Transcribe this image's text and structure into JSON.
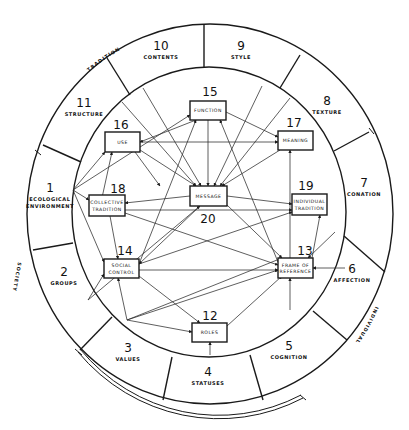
{
  "diagram": {
    "outer_ring": {
      "cx": 210,
      "cy": 214,
      "rx": 183,
      "ry": 190
    },
    "inner_ring": {
      "cx": 209,
      "cy": 212,
      "rx": 137,
      "ry": 145
    },
    "groups": [
      {
        "id": "tradition",
        "label": "TRADITION"
      },
      {
        "id": "society",
        "label": "SOCIETY"
      },
      {
        "id": "individual",
        "label": "INDIVIDUAL"
      }
    ],
    "ring_sections": [
      {
        "number": "1",
        "label_lines": [
          "ECOLOGICAL",
          "ENVIRONMENT"
        ],
        "x": 50,
        "y": 192
      },
      {
        "number": "2",
        "label_lines": [
          "GROUPS"
        ],
        "x": 64,
        "y": 276
      },
      {
        "number": "3",
        "label_lines": [
          "VALUES"
        ],
        "x": 128,
        "y": 352
      },
      {
        "number": "4",
        "label_lines": [
          "STATUSES"
        ],
        "x": 208,
        "y": 376
      },
      {
        "number": "5",
        "label_lines": [
          "COGNITION"
        ],
        "x": 289,
        "y": 350
      },
      {
        "number": "6",
        "label_lines": [
          "AFFECTION"
        ],
        "x": 352,
        "y": 273
      },
      {
        "number": "7",
        "label_lines": [
          "CONATION"
        ],
        "x": 364,
        "y": 187
      },
      {
        "number": "8",
        "label_lines": [
          "TEXTURE"
        ],
        "x": 327,
        "y": 105
      },
      {
        "number": "9",
        "label_lines": [
          "STYLE"
        ],
        "x": 241,
        "y": 50
      },
      {
        "number": "10",
        "label_lines": [
          "CONTENTS"
        ],
        "x": 161,
        "y": 50
      },
      {
        "number": "11",
        "label_lines": [
          "STRUCTURE"
        ],
        "x": 84,
        "y": 107
      }
    ],
    "boxes": [
      {
        "id": "function",
        "number": "15",
        "label_lines": [
          "FUNCTION"
        ],
        "x": 190,
        "y": 101,
        "w": 36,
        "h": 19,
        "num_x": 210,
        "num_y": 96
      },
      {
        "id": "use",
        "number": "16",
        "label_lines": [
          "USE"
        ],
        "x": 105,
        "y": 132,
        "w": 35,
        "h": 20,
        "num_x": 121,
        "num_y": 129
      },
      {
        "id": "meaning",
        "number": "17",
        "label_lines": [
          "MEANING"
        ],
        "x": 278,
        "y": 131,
        "w": 35,
        "h": 19,
        "num_x": 294,
        "num_y": 127
      },
      {
        "id": "collective-tradition",
        "number": "18",
        "label_lines": [
          "COLLECTIVE",
          "TRADITION"
        ],
        "x": 89,
        "y": 195,
        "w": 36,
        "h": 21,
        "num_x": 118,
        "num_y": 193
      },
      {
        "id": "individual-tradition",
        "number": "19",
        "label_lines": [
          "INDIVIDUAL",
          "TRADITION"
        ],
        "x": 292,
        "y": 194,
        "w": 35,
        "h": 21,
        "num_x": 306,
        "num_y": 190
      },
      {
        "id": "message",
        "number": "20",
        "label_lines": [
          "MESSAGE"
        ],
        "x": 190,
        "y": 186,
        "w": 37,
        "h": 20,
        "num_x": 208,
        "num_y": 223
      },
      {
        "id": "social-control",
        "number": "14",
        "label_lines": [
          "SOCIAL",
          "CONTROL"
        ],
        "x": 104,
        "y": 259,
        "w": 35,
        "h": 19,
        "num_x": 125,
        "num_y": 255
      },
      {
        "id": "frame-of-reference",
        "number": "13",
        "label_lines": [
          "FRAME OF",
          "REFERENCE"
        ],
        "x": 278,
        "y": 258,
        "w": 35,
        "h": 20,
        "num_x": 305,
        "num_y": 255
      },
      {
        "id": "roles",
        "number": "12",
        "label_lines": [
          "ROLES"
        ],
        "x": 192,
        "y": 323,
        "w": 35,
        "h": 19,
        "num_x": 210,
        "num_y": 320
      }
    ],
    "dividers": [
      [
        204,
        24,
        204,
        68
      ],
      [
        300,
        55,
        280,
        88
      ],
      [
        369,
        132,
        334,
        151
      ],
      [
        385,
        272,
        344,
        236
      ],
      [
        347,
        340,
        313,
        311
      ],
      [
        263,
        400,
        250,
        355
      ],
      [
        163,
        400,
        172,
        357
      ],
      [
        80,
        350,
        112,
        317
      ],
      [
        33,
        250,
        73,
        243
      ],
      [
        43,
        145,
        81,
        162
      ],
      [
        107,
        58,
        130,
        95
      ]
    ],
    "connections": [
      [
        208,
        120,
        208,
        186
      ],
      [
        196,
        120,
        140,
        142
      ],
      [
        226,
        112,
        278,
        137
      ],
      [
        140,
        142,
        278,
        142
      ],
      [
        140,
        150,
        196,
        186
      ],
      [
        280,
        150,
        222,
        186
      ],
      [
        122,
        102,
        196,
        186
      ],
      [
        143,
        88,
        201,
        186
      ],
      [
        262,
        86,
        214,
        186
      ],
      [
        290,
        98,
        220,
        186
      ],
      [
        190,
        196,
        125,
        203
      ],
      [
        227,
        196,
        292,
        204
      ],
      [
        125,
        210,
        292,
        210
      ],
      [
        125,
        213,
        278,
        265
      ],
      [
        227,
        205,
        282,
        258
      ],
      [
        73,
        190,
        105,
        152
      ],
      [
        73,
        190,
        190,
        115
      ],
      [
        73,
        190,
        89,
        200
      ],
      [
        73,
        190,
        104,
        262
      ],
      [
        110,
        216,
        118,
        259
      ],
      [
        98,
        216,
        112,
        152
      ],
      [
        139,
        264,
        196,
        120
      ],
      [
        139,
        264,
        292,
        212
      ],
      [
        139,
        270,
        278,
        270
      ],
      [
        139,
        276,
        200,
        323
      ],
      [
        88,
        300,
        104,
        274
      ],
      [
        88,
        300,
        200,
        206
      ],
      [
        127,
        320,
        118,
        278
      ],
      [
        127,
        320,
        192,
        332
      ],
      [
        127,
        320,
        278,
        270
      ],
      [
        127,
        320,
        282,
        258
      ],
      [
        227,
        326,
        282,
        276
      ],
      [
        210,
        355,
        210,
        342
      ],
      [
        290,
        310,
        290,
        278
      ],
      [
        345,
        268,
        313,
        268
      ],
      [
        312,
        258,
        320,
        215
      ],
      [
        290,
        258,
        290,
        150
      ],
      [
        278,
        262,
        220,
        120
      ],
      [
        335,
        232,
        308,
        258
      ],
      [
        135,
        152,
        160,
        186
      ],
      [
        200,
        206,
        139,
        264
      ]
    ]
  }
}
